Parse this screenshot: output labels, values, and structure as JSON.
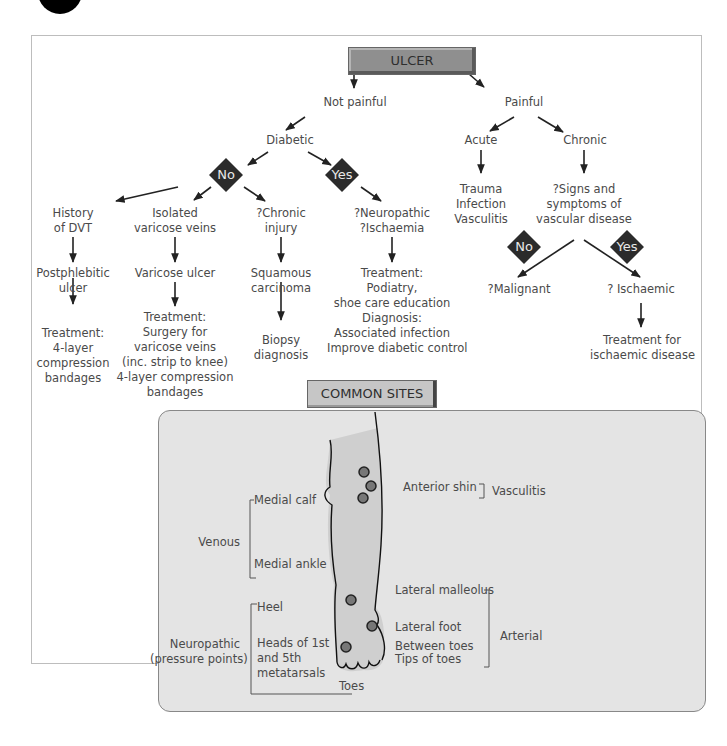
{
  "root": {
    "label": "ULCER"
  },
  "branches": {
    "not_painful": "Not painful",
    "painful": "Painful",
    "diabetic": "Diabetic",
    "acute": "Acute",
    "chronic": "Chronic"
  },
  "decisions": {
    "diabetic_no": "No",
    "diabetic_yes": "Yes",
    "vascular_no": "No",
    "vascular_yes": "Yes"
  },
  "non_diabetic": {
    "dvt": {
      "cause": [
        "History",
        "of DVT"
      ],
      "ulcer": [
        "Postphlebitic",
        "ulcer"
      ],
      "treatment": [
        "Treatment:",
        "4-layer",
        "compression",
        "bandages"
      ]
    },
    "varicose": {
      "cause": [
        "Isolated",
        "varicose veins"
      ],
      "ulcer": [
        "Varicose ulcer"
      ],
      "treatment": [
        "Treatment:",
        "Surgery for",
        "varicose veins",
        "(inc. strip to knee)",
        "4-layer compression",
        "bandages"
      ]
    },
    "chronic_injury": {
      "cause": [
        "?Chronic",
        "injury"
      ],
      "ulcer": [
        "Squamous",
        "carcinoma"
      ],
      "treatment": [
        "Biopsy",
        "diagnosis"
      ]
    }
  },
  "diabetic_path": {
    "cause": [
      "?Neuropathic",
      "?Ischaemia"
    ],
    "treatment": [
      "Treatment:",
      "Podiatry,",
      "shoe care education",
      "Diagnosis:",
      "Associated infection",
      "Improve diabetic control"
    ]
  },
  "acute_causes": [
    "Trauma",
    "Infection",
    "Vasculitis"
  ],
  "chronic_path": {
    "question": [
      "?Signs and",
      "symptoms of",
      "vascular disease"
    ],
    "no_result": "?Malignant",
    "yes_result": "? Ischaemic",
    "yes_treatment": [
      "Treatment for",
      "ischaemic disease"
    ]
  },
  "common_sites": {
    "title": "COMMON SITES",
    "venous": {
      "group": "Venous",
      "sites": [
        "Medial calf",
        "Medial ankle"
      ]
    },
    "vasculitis": {
      "group": "Vasculitis",
      "sites": [
        "Anterior shin"
      ]
    },
    "neuropathic": {
      "group": [
        "Neuropathic",
        "(pressure points)"
      ],
      "sites": [
        "Heel",
        "Heads of 1st",
        "and 5th",
        "metatarsals",
        "Toes"
      ]
    },
    "arterial": {
      "group": "Arterial",
      "sites": [
        "Lateral malleolus",
        "Lateral foot",
        "Between toes",
        "Tips of toes"
      ]
    }
  },
  "colors": {
    "title_box": "#8f8f8f",
    "sites_title_box": "#c6c6c6",
    "panel_bg": "#e4e4e4",
    "diamond": "#2b2b2b",
    "leg_fill": "#cfcfcf"
  }
}
